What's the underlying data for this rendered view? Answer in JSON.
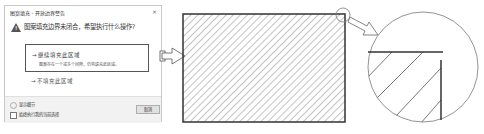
{
  "dialog": {
    "title": "图案填充 - 开放边界警告",
    "close_glyph": "×",
    "question": "图案填充边界未闭合，希望执行什么操作?",
    "option_continue": {
      "label": "→ 继续填充此区域",
      "description": "图案存在一个或多个间隙，仍将填充此区域。"
    },
    "option_skip": {
      "label": "→ 不填充此区域"
    },
    "details_label": "显示细节",
    "always_label": "始终执行我的当前选择",
    "cancel_label": "取消"
  },
  "illustration": {
    "hatch_color": "#777777",
    "border_color": "#333333",
    "circle_color": "#777777"
  }
}
